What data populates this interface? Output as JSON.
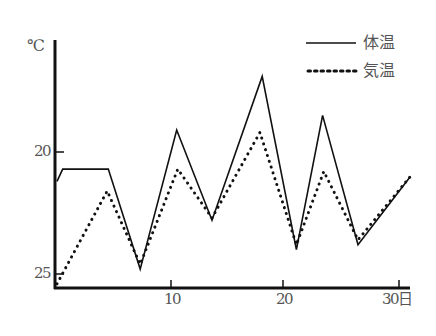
{
  "chart_data": {
    "type": "line",
    "title": "",
    "xlabel": "日",
    "ylabel": "℃",
    "x_ticks": [
      10,
      20,
      30
    ],
    "x_tick_labels": [
      "10",
      "20",
      "30日"
    ],
    "y_ticks": [
      20,
      25
    ],
    "y_tick_labels": [
      "20",
      "25"
    ],
    "y_axis_reversed_as_drawn": true,
    "xlim": [
      0,
      31
    ],
    "grid": false,
    "legend_position": "top-right",
    "series": [
      {
        "name": "体温",
        "style": "solid",
        "x": [
          0,
          0.5,
          4.5,
          7.3,
          10.5,
          13.6,
          18.0,
          21.0,
          23.3,
          26.4,
          31.0
        ],
        "values": [
          21.2,
          20.7,
          20.7,
          24.8,
          19.1,
          22.8,
          16.9,
          24.0,
          18.5,
          23.8,
          21.0
        ]
      },
      {
        "name": "気温",
        "style": "dotted",
        "x": [
          0,
          4.4,
          7.3,
          10.6,
          13.6,
          17.8,
          21.0,
          23.4,
          26.4,
          31.0
        ],
        "values": [
          25.4,
          21.6,
          24.6,
          20.7,
          22.7,
          19.2,
          23.8,
          20.8,
          23.6,
          21.0
        ]
      }
    ]
  },
  "axis": {
    "y_unit": "℃",
    "y_labels": [
      "20",
      "25"
    ],
    "x_labels": [
      "10",
      "20",
      "30日"
    ]
  },
  "legend": {
    "items": [
      {
        "label": "体温",
        "style": "solid"
      },
      {
        "label": "気温",
        "style": "dotted"
      }
    ]
  },
  "colors": {
    "line": "#111111",
    "text": "#555555"
  }
}
